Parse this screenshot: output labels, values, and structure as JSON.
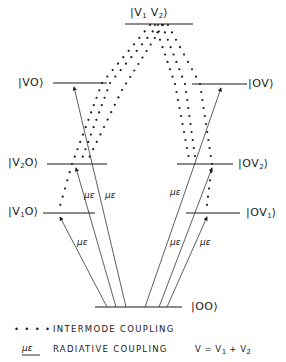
{
  "diagram": {
    "levels": {
      "top": {
        "label": "|V1 V2⟩"
      },
      "vo": {
        "label": "|VO⟩"
      },
      "ov": {
        "label": "|OV⟩"
      },
      "v2o": {
        "label": "|V2O⟩"
      },
      "ov2": {
        "label": "|OV2⟩"
      },
      "v1o": {
        "label": "|V1O⟩"
      },
      "ov1": {
        "label": "|OV1⟩"
      },
      "ground": {
        "label": "|OO⟩"
      }
    },
    "radiative_label": "με",
    "legend": {
      "intermode_symbol": "• • • •",
      "intermode_text": "INTERMODE COUPLING",
      "radiative_symbol": "με",
      "radiative_text": "RADIATIVE COUPLING",
      "equation": "V = V1 + V2"
    },
    "colors": {
      "line": "#1a1a1a",
      "background": "#ffffff"
    }
  }
}
